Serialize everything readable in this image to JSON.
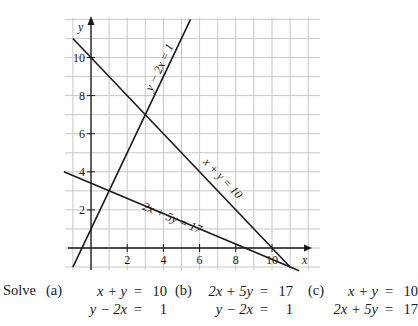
{
  "graph": {
    "axes": {
      "x_label": "x",
      "y_label": "y"
    },
    "x_ticks": [
      "2",
      "4",
      "6",
      "8",
      "10"
    ],
    "y_ticks": [
      "2",
      "4",
      "6",
      "8",
      "10"
    ],
    "line_labels": {
      "line1": "y − 2x = 1",
      "line2": "x + y = 10",
      "line3": "2x + 5y = 17"
    },
    "colors": {
      "grid": "#c8c8c8",
      "line": "#1a1a1a",
      "axis": "#1a1a1a"
    }
  },
  "problem": {
    "prompt": "Solve",
    "parts": [
      {
        "label": "(a)",
        "eq1_lhs": "x + y",
        "eq1_rhs": "10",
        "eq2_lhs": "y − 2x",
        "eq2_rhs": "1"
      },
      {
        "label": "(b)",
        "eq1_lhs": "2x + 5y",
        "eq1_rhs": "17",
        "eq2_lhs": "y − 2x",
        "eq2_rhs": "1"
      },
      {
        "label": "(c)",
        "eq1_lhs": "x + y",
        "eq1_rhs": "10",
        "eq2_lhs": "2x + 5y",
        "eq2_rhs": "17"
      }
    ],
    "equals": "="
  },
  "chart_data": {
    "type": "line",
    "title": "",
    "xlabel": "x",
    "ylabel": "y",
    "xlim": [
      -1.5,
      12.5
    ],
    "ylim": [
      -1,
      12
    ],
    "grid": true,
    "x_ticks": [
      2,
      4,
      6,
      8,
      10
    ],
    "y_ticks": [
      2,
      4,
      6,
      8,
      10
    ],
    "series": [
      {
        "name": "y − 2x = 1",
        "x": [
          -1,
          5.5
        ],
        "y": [
          -1,
          12
        ]
      },
      {
        "name": "x + y = 10",
        "x": [
          -1,
          11
        ],
        "y": [
          11,
          -1
        ]
      },
      {
        "name": "2x + 5y = 17",
        "x": [
          -1.5,
          11.5
        ],
        "y": [
          4,
          -1.2
        ]
      }
    ],
    "intersections": [
      {
        "lines": [
          "x + y = 10",
          "y − 2x = 1"
        ],
        "point": [
          3,
          7
        ]
      },
      {
        "lines": [
          "2x + 5y = 17",
          "y − 2x = 1"
        ],
        "point": [
          1,
          3
        ]
      },
      {
        "lines": [
          "x + y = 10",
          "2x + 5y = 17"
        ],
        "point": [
          11,
          -1
        ]
      }
    ]
  }
}
